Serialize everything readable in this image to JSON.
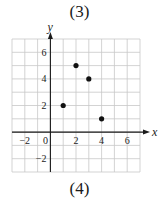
{
  "panel_labels": {
    "top": "(3)",
    "bottom": "(4)"
  },
  "chart_data": {
    "type": "scatter",
    "title": "",
    "xlabel": "x",
    "ylabel": "y",
    "xlim": [
      -3,
      7
    ],
    "ylim": [
      -3,
      7
    ],
    "grid": true,
    "x_ticks": [
      -2,
      0,
      2,
      4,
      6
    ],
    "y_ticks": [
      -2,
      2,
      4,
      6
    ],
    "series": [
      {
        "name": "points",
        "points": [
          {
            "x": 1,
            "y": 2
          },
          {
            "x": 2,
            "y": 5
          },
          {
            "x": 3,
            "y": 4
          },
          {
            "x": 4,
            "y": 1
          }
        ]
      }
    ],
    "colors": {
      "grid": "#c8c8c8",
      "axis": "#1a1a1a",
      "point": "#111111"
    }
  }
}
